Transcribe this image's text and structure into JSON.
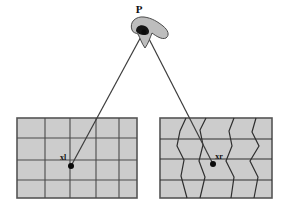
{
  "figure": {
    "type": "diagram",
    "background_color": "#ffffff"
  },
  "scene_point": {
    "label": "P",
    "label_x": 139,
    "label_y": 13,
    "x": 143,
    "y": 32,
    "marker": "scene-point-marker"
  },
  "camera_blob": {
    "name": "camera-silhouette",
    "fill_color": "#bdbdbd",
    "stroke_color": "#4a4a4a"
  },
  "rays": [
    {
      "name": "ray-left",
      "from_x": 143,
      "from_y": 33,
      "to_x": 71,
      "to_y": 166,
      "color": "#3c3c3c"
    },
    {
      "name": "ray-right",
      "from_x": 146,
      "from_y": 33,
      "to_x": 213,
      "to_y": 164,
      "color": "#3c3c3c"
    }
  ],
  "panels": [
    {
      "name": "left-image-plane",
      "kind": "regular-grid",
      "x": 17,
      "y": 118,
      "width": 120,
      "height": 80,
      "fill_color": "#cccccc",
      "border_color": "#555555",
      "grid_color": "#4a4a4a",
      "columns": 5,
      "rows": 4,
      "point": {
        "label": "xl",
        "label_x": 63,
        "label_y": 159,
        "x": 71,
        "y": 166
      }
    },
    {
      "name": "right-image-plane",
      "kind": "warped-grid",
      "x": 160,
      "y": 118,
      "width": 112,
      "height": 80,
      "fill_color": "#cccccc",
      "border_color": "#555555",
      "grid_color": "#2e2e2e",
      "columns": 5,
      "rows": 4,
      "point": {
        "label": "xr",
        "label_x": 216,
        "label_y": 158,
        "x": 213,
        "y": 164
      }
    }
  ],
  "colors": {
    "panel_fill": "#cccccc",
    "panel_border": "#555555",
    "grid_line": "#4a4a4a",
    "warped_line": "#2e2e2e",
    "ray_line": "#3c3c3c",
    "marker": "#0a0a0a",
    "blob_fill": "#bdbdbd",
    "blob_stroke": "#4a4a4a",
    "text": "#101010"
  }
}
